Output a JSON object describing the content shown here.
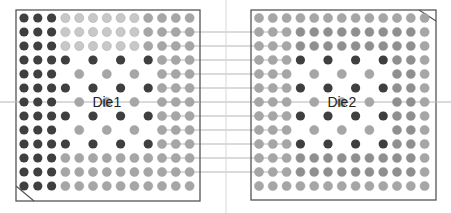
{
  "diagram": {
    "colors": {
      "dark": "#3f3f3f",
      "light": "#c8c8c8",
      "medium": "#a6a6a6",
      "medium2": "#8f8f8f",
      "border": "#555555",
      "wire": "#b5b5b5",
      "background": "#ffffff"
    },
    "legend_codes": {
      "D": "dark",
      "L": "light",
      "M": "medium",
      "N": "medium2",
      ".": "empty"
    },
    "dies": [
      {
        "id": "die1",
        "label": "Die1",
        "grid": [
          "DDDLLLLLLMMMM",
          "DDDLLLLLLMMMM",
          "DDDLLLLLLMMMM",
          "DDDD.D.D.DMMM",
          "DDD.M.M.M.MMM",
          "DDDD.D.D.DMMM",
          "DDD.M.M.M.MMM",
          "DDDD.D.D.DMMM",
          "DDD.M.M.M.MMM",
          "DDDD.D.D.DMMM",
          "DDDMMMMMMMMMM",
          "DDDMMMMMMMMMM",
          "DDDMMMMMMMMMM"
        ]
      },
      {
        "id": "die2",
        "label": "Die2",
        "grid": [
          "MMMMMMMMMMMMM",
          "MMMNNNNNNNNNM",
          "MMMNNNNNNNNNM",
          "MMMD.D.D.DNNM",
          "MMM.M.M.M.NNM",
          "MMMD.D.D.DNNM",
          "MMM.M.M.M.NNM",
          "MMMD.D.D.DNNM",
          "MMM.M.M.M.NNM",
          "MMMD.D.D.DNNM",
          "MMMNNNNNNNNNM",
          "MMMNNNNNNNNNM",
          "MMMMMMMMMMMMM"
        ]
      }
    ],
    "interconnect": {
      "connected_rows": [
        1,
        2,
        3,
        4,
        5,
        6,
        7,
        8,
        9,
        10,
        11
      ],
      "die1_wire_columns": [
        10,
        11,
        12
      ],
      "die2_wire_columns": [
        0,
        1,
        2
      ],
      "center_line_row": 6
    },
    "corner_marks": {
      "die1": "bottom-left",
      "die2": "top-right"
    }
  }
}
